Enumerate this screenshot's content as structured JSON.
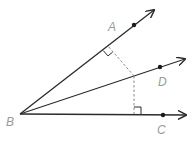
{
  "diagram": {
    "vertex": {
      "name": "B",
      "label": "B"
    },
    "rays": [
      {
        "name": "BA",
        "point_label": "A"
      },
      {
        "name": "BD",
        "point_label": "D"
      },
      {
        "name": "BC",
        "point_label": "C"
      }
    ],
    "labels": {
      "A": "A",
      "B": "B",
      "C": "C",
      "D": "D"
    },
    "markers": {
      "perpendicular_to_BA": "right-angle",
      "perpendicular_to_BC": "right-angle"
    },
    "colors": {
      "line": "#2b2b2b",
      "dashed": "#8a8a8a",
      "label": "#9a9a9a"
    }
  }
}
